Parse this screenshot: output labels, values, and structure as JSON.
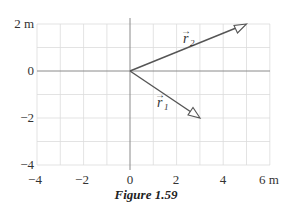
{
  "figure": {
    "caption": "Figure 1.59",
    "y_axis_ticks": [
      {
        "value": 2,
        "label": "2 m"
      },
      {
        "value": 0,
        "label": "0"
      },
      {
        "value": -2,
        "label": "−2"
      },
      {
        "value": -4,
        "label": "−4"
      }
    ],
    "x_axis_ticks": [
      {
        "value": -4,
        "label": "−4"
      },
      {
        "value": -2,
        "label": "−2"
      },
      {
        "value": 0,
        "label": "0"
      },
      {
        "value": 2,
        "label": "2"
      },
      {
        "value": 4,
        "label": "4"
      },
      {
        "value": 6,
        "label": "6 m"
      }
    ],
    "vectors": [
      {
        "name": "r1",
        "label": "r",
        "subscript": "1",
        "from": [
          0,
          0
        ],
        "to": [
          3,
          -2
        ]
      },
      {
        "name": "r2",
        "label": "r",
        "subscript": "2",
        "from": [
          0,
          0
        ],
        "to": [
          5,
          2
        ]
      }
    ],
    "x_range": [
      -4,
      6
    ],
    "y_range": [
      -4,
      2
    ],
    "grid": "1 m spacing",
    "colors": {
      "grid": "#d9d9d9",
      "axis": "#888888",
      "vector": "#555555",
      "text": "#333333"
    }
  }
}
